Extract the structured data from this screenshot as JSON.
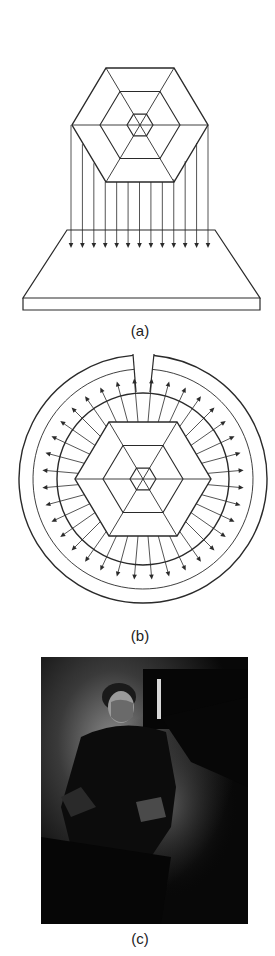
{
  "figure": {
    "panels": [
      {
        "id": "a",
        "caption": "(a)",
        "description": "Hexagonal object projecting parallel rays downward onto a flat plate",
        "arrow_count": 13
      },
      {
        "id": "b",
        "caption": "(b)",
        "description": "Hexagonal object at center of cylindrical film with rays radiating outward; slit at top",
        "arrow_count": 36
      },
      {
        "id": "c",
        "caption": "(c)",
        "description": "Photograph of a seated man in a dark room"
      }
    ]
  },
  "colors": {
    "line": "#2a2a2a",
    "background": "#ffffff",
    "photo_dark": "#0a0a0a"
  }
}
